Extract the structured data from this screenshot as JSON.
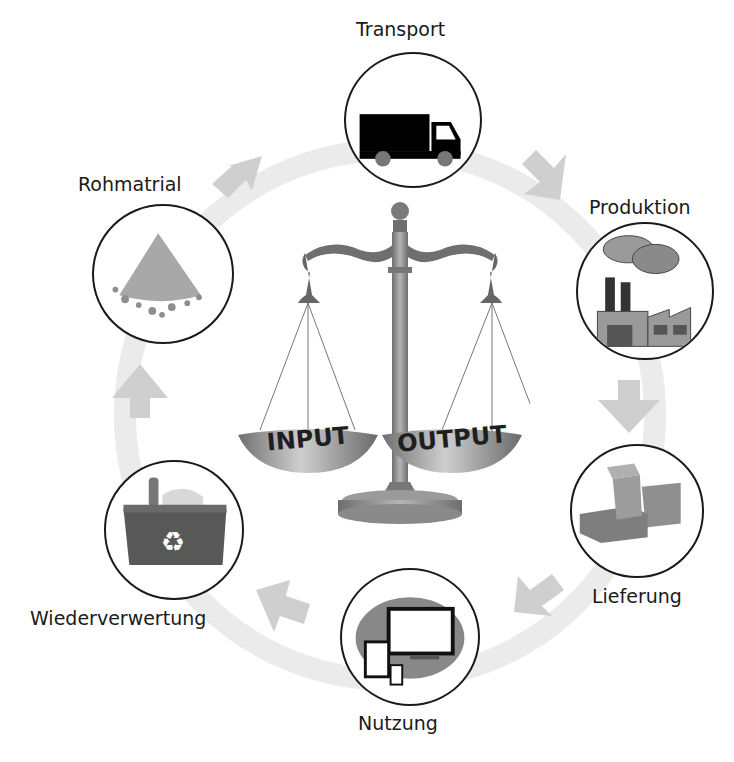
{
  "diagram": {
    "type": "cycle",
    "center": {
      "graphic": "balance-scale",
      "left_pan_label": "INPUT",
      "right_pan_label": "OUTPUT"
    },
    "stages": [
      {
        "id": "transport",
        "label": "Transport",
        "icon": "truck-icon"
      },
      {
        "id": "produktion",
        "label": "Produktion",
        "icon": "factory-icon"
      },
      {
        "id": "lieferung",
        "label": "Lieferung",
        "icon": "boxes-icon"
      },
      {
        "id": "nutzung",
        "label": "Nutzung",
        "icon": "devices-icon"
      },
      {
        "id": "wiederverwertung",
        "label": "Wiederverwertung",
        "icon": "recycle-bin-icon"
      },
      {
        "id": "rohmatrial",
        "label": "Rohmatrial",
        "icon": "material-pile-icon"
      }
    ],
    "flow_direction": "clockwise",
    "colors": {
      "ring": "#e6e6e6",
      "arrow": "#cccccc",
      "circle_border": "#1a1a1a",
      "scale_metal": "#8a8a8a",
      "text": "#1a1a1a"
    }
  }
}
